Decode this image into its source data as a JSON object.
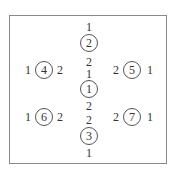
{
  "diagram": {
    "nodes": [
      {
        "id": "1",
        "x": 89,
        "y": 89
      },
      {
        "id": "2",
        "x": 89,
        "y": 43
      },
      {
        "id": "3",
        "x": 89,
        "y": 136
      },
      {
        "id": "4",
        "x": 44,
        "y": 70
      },
      {
        "id": "5",
        "x": 132,
        "y": 70
      },
      {
        "id": "6",
        "x": 44,
        "y": 117
      },
      {
        "id": "7",
        "x": 132,
        "y": 117
      }
    ],
    "labels": [
      {
        "text": "1",
        "x": 89,
        "y": 27
      },
      {
        "text": "2",
        "x": 89,
        "y": 62
      },
      {
        "text": "1",
        "x": 89,
        "y": 74
      },
      {
        "text": "2",
        "x": 89,
        "y": 106
      },
      {
        "text": "2",
        "x": 89,
        "y": 120
      },
      {
        "text": "1",
        "x": 89,
        "y": 153
      },
      {
        "text": "1",
        "x": 28,
        "y": 70
      },
      {
        "text": "2",
        "x": 60,
        "y": 70
      },
      {
        "text": "2",
        "x": 116,
        "y": 70
      },
      {
        "text": "1",
        "x": 150,
        "y": 70
      },
      {
        "text": "1",
        "x": 28,
        "y": 117
      },
      {
        "text": "2",
        "x": 60,
        "y": 117
      },
      {
        "text": "2",
        "x": 116,
        "y": 117
      },
      {
        "text": "1",
        "x": 150,
        "y": 117
      }
    ]
  }
}
